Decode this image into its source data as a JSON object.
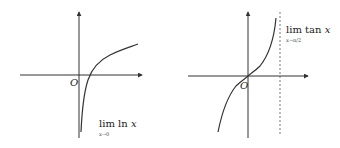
{
  "left_graph": {
    "function": "ln x",
    "origin_label": "O",
    "limit_label": "lim ln x",
    "limit_main": "lim",
    "limit_func": "ln",
    "limit_var": "x",
    "limit_sub": "x→0"
  },
  "right_graph": {
    "function": "tan x",
    "origin_label": "O",
    "limit_label": "lim tan x",
    "limit_main": "lim",
    "limit_func": "tan",
    "limit_var": "x",
    "limit_sub": "x→π/2",
    "asymptote": "x = π/2 (dashed)"
  },
  "colors": {
    "stroke": "#333333",
    "background": "#ffffff"
  }
}
